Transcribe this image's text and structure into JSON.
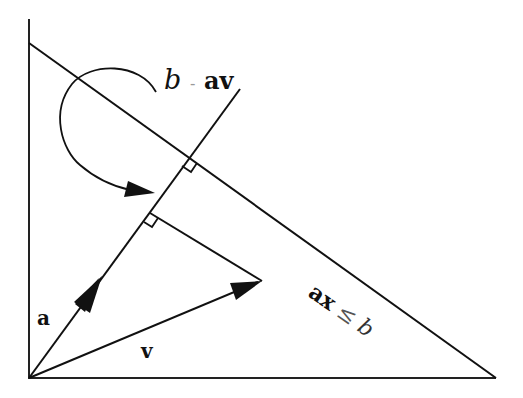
{
  "diagram": {
    "type": "geometry-vector-projection",
    "labels": {
      "projection_label": {
        "b": "b",
        "op": "-",
        "av": "av"
      },
      "vector_a": "a",
      "vector_v": "v",
      "constraint": {
        "ax": "ax",
        "op": "≤",
        "b": "b"
      }
    },
    "colors": {
      "stroke": "#111111",
      "background": "#ffffff"
    },
    "elements": [
      "vertical-axis",
      "horizontal-axis",
      "constraint-line ax = b",
      "line along vector a",
      "vector a arrow",
      "vector v arrow",
      "perpendicular from v to line a",
      "right-angle marker at constraint intersection",
      "right-angle marker at v projection",
      "curved arrow labeled b - av"
    ]
  }
}
